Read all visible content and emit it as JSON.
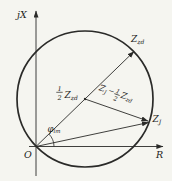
{
  "figure": {
    "title_semantic": "mho-relay-impedance-circle-diagram",
    "background_color": "#f5f5f0",
    "line_color": "#2a2a28",
    "axes": {
      "y_label": "jX",
      "x_label": "R",
      "origin_label": "O"
    },
    "vectors": {
      "setting_impedance": {
        "base": "Z",
        "sub": "zd"
      },
      "half_setting_impedance": {
        "numerator": "1",
        "denominator": "2",
        "base": "Z",
        "sub": "zd"
      },
      "measured_impedance": {
        "base": "Z",
        "sub": "J"
      },
      "difference": {
        "term1_base": "Z",
        "term1_sub": "J",
        "operator": "−",
        "numerator": "1",
        "denominator": "2",
        "term2_base": "Z",
        "term2_sub": "zd"
      }
    },
    "angle": {
      "symbol": "φ",
      "sub": "lm"
    }
  }
}
